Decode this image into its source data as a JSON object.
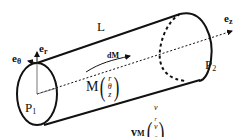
{
  "diagram": {
    "type": "cylinder-coordinates",
    "labels": {
      "length": "L",
      "e_theta": {
        "base": "e",
        "sub": "θ"
      },
      "e_r": {
        "base": "e",
        "sub": "r"
      },
      "e_z": {
        "base": "e",
        "sub": "z"
      },
      "dM": "dM",
      "M": "M",
      "M_components": [
        "r",
        "θ",
        "z"
      ],
      "P1": {
        "base": "P",
        "sub": "1"
      },
      "P2": {
        "base": "P",
        "sub": "2"
      },
      "vM": {
        "base": "v",
        "sub": "M"
      },
      "vM_components": [
        {
          "base": "v",
          "sub": "r"
        },
        {
          "base": "v",
          "sub": "θ"
        },
        {
          "base": "v",
          "sub": "z"
        }
      ]
    },
    "colors": {
      "stroke": "#111111",
      "background": "#ffffff"
    }
  }
}
